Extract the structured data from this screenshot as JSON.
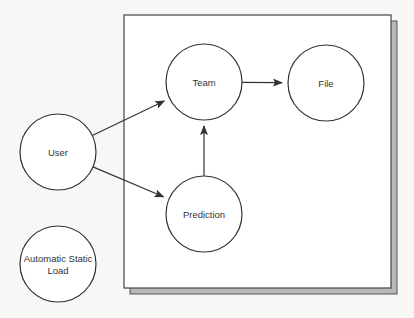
{
  "diagram": {
    "type": "context-diagram",
    "boundary": {
      "label": ""
    },
    "nodes": [
      {
        "id": "user",
        "label_lines": [
          "User"
        ],
        "inside_boundary": false
      },
      {
        "id": "team",
        "label_lines": [
          "Team"
        ],
        "inside_boundary": true
      },
      {
        "id": "file",
        "label_lines": [
          "File"
        ],
        "inside_boundary": true
      },
      {
        "id": "prediction",
        "label_lines": [
          "Prediction"
        ],
        "inside_boundary": true
      },
      {
        "id": "automatic-static-load",
        "label_lines": [
          "Automatic Static",
          "Load"
        ],
        "inside_boundary": false
      }
    ],
    "edges": [
      {
        "from": "user",
        "to": "team"
      },
      {
        "from": "user",
        "to": "prediction"
      },
      {
        "from": "team",
        "to": "file"
      },
      {
        "from": "prediction",
        "to": "team"
      }
    ],
    "colors": {
      "stroke": "#333333",
      "box_fill": "#ffffff",
      "shadow": "#b8b8b8",
      "background": "#f7f7f5"
    }
  }
}
